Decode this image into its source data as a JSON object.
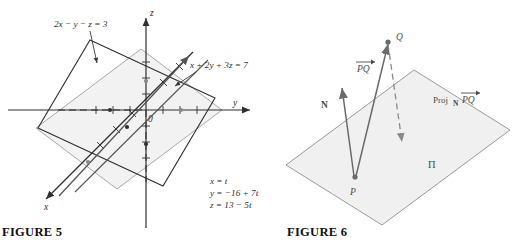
{
  "figure5": {
    "caption": "FIGURE 5",
    "axes": {
      "x_label": "x",
      "y_label": "y",
      "z_label": "z",
      "origin_label": "0"
    },
    "planes": [
      {
        "id": "plane-dark",
        "equation": "2x − y − z = 3",
        "color": "#2f2f2f",
        "fill": "#ffffff"
      },
      {
        "id": "plane-gray",
        "equation": "x + 2y + 3z = 7",
        "color": "#9a9a9a",
        "fill": "#f2f2f2"
      }
    ],
    "intersection_line": {
      "label_lines": [
        "x = t",
        "y = −16 + 7t",
        "z = 13 − 5t"
      ],
      "color": "#555555"
    }
  },
  "figure6": {
    "caption": "FIGURE 6",
    "plane": {
      "label": "Π",
      "fill": "#f0f0f0",
      "stroke": "#9a9a9a"
    },
    "points": [
      {
        "name": "P",
        "label": "P"
      },
      {
        "name": "Q",
        "label": "Q"
      }
    ],
    "vectors": [
      {
        "name": "PQ",
        "label": "PQ",
        "overbar": true,
        "color": "#6a6a6a"
      },
      {
        "name": "N",
        "label": "N",
        "overbar": false,
        "color": "#6a6a6a"
      }
    ],
    "projection": {
      "prefix": "Proj",
      "subscript": "N",
      "vector_label": "PQ",
      "color": "#8a8a8a"
    }
  },
  "colors": {
    "ink": "#2f2f2f",
    "gray_line": "#9a9a9a",
    "mid_gray": "#6a6a6a",
    "paper": "#ffffff"
  }
}
